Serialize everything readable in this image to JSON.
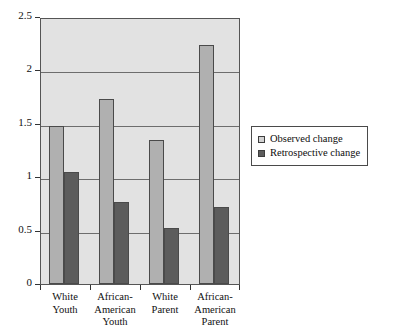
{
  "chart_data": {
    "type": "bar",
    "title": "",
    "xlabel": "",
    "ylabel": "",
    "ylim": [
      0,
      2.5
    ],
    "yticks": [
      "0",
      "0.5",
      "1",
      "1.5",
      "2",
      "2.5"
    ],
    "ytick_values": [
      0,
      0.5,
      1,
      1.5,
      2,
      2.5
    ],
    "grid": true,
    "legend_position": "right",
    "categories": [
      "White Youth",
      "African-American Youth",
      "White Parent",
      "African-American Parent"
    ],
    "category_lines": [
      [
        "White",
        "Youth"
      ],
      [
        "African-",
        "American",
        "Youth"
      ],
      [
        "White",
        "Parent"
      ],
      [
        "African-",
        "American",
        "Parent"
      ]
    ],
    "series": [
      {
        "name": "Observed change",
        "color": "#b0b0b0",
        "values": [
          1.48,
          1.73,
          1.35,
          2.24
        ]
      },
      {
        "name": "Retrospective change",
        "color": "#5c5c5c",
        "values": [
          1.05,
          0.77,
          0.52,
          0.72
        ]
      }
    ]
  },
  "legend": {
    "items": [
      {
        "label": "Observed change",
        "swatch": "observed"
      },
      {
        "label": "Retrospective change",
        "swatch": "retrospective"
      }
    ]
  },
  "colors": {
    "plot_background": "#e2e2e2",
    "gridline": "#6d6d6d",
    "axis": "#555555",
    "observed_bar": "#b0b0b0",
    "retrospective_bar": "#5c5c5c",
    "page_background": "#ffffff"
  }
}
